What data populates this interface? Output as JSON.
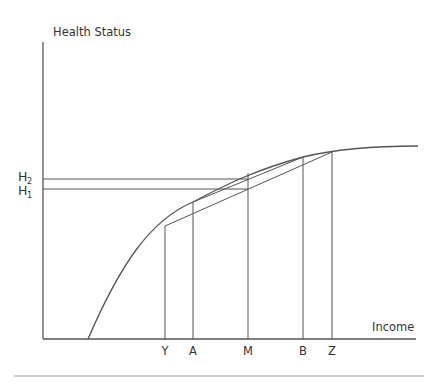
{
  "diagram": {
    "y_axis_label": "Health Status",
    "x_axis_label": "Income",
    "y_ticks": [
      {
        "base": "H",
        "sub": "2"
      },
      {
        "base": "H",
        "sub": "1"
      }
    ],
    "x_ticks": [
      "Y",
      "A",
      "M",
      "B",
      "Z"
    ],
    "colors": {
      "line": "#555555",
      "text": "#333333",
      "rule": "#bdbdbd"
    }
  }
}
